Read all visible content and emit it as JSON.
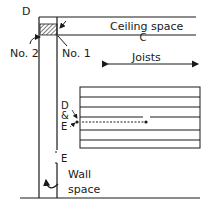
{
  "diagram": {
    "labels": {
      "d_top": "D",
      "c": "C",
      "ceiling_space": "Ceiling space",
      "joists": "Joists",
      "no1": "No. 1",
      "no2": "No. 2",
      "d_amp_e_d": "D",
      "d_amp_e_amp": "&",
      "d_amp_e_e": "E",
      "e_bottom": "E",
      "wall": "Wall",
      "space": "space"
    },
    "colors": {
      "line": "#1a1a1a",
      "background": "#ffffff"
    }
  }
}
